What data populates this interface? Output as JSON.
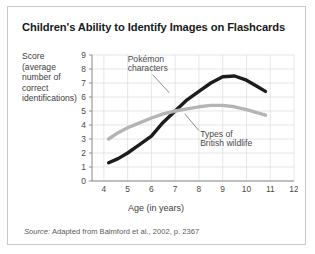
{
  "figure": {
    "title": "Children's Ability to Identify Images on Flashcards",
    "y_axis_caption": "Score (average number of correct identifications)",
    "source_prefix": "Source:",
    "source_text": "Adapted from Balmford et al., 2002, p. 2367"
  },
  "chart_data": {
    "type": "line",
    "title": "Children's Ability to Identify Images on Flashcards",
    "xlabel": "Age (in years)",
    "ylabel": "Score (average number of correct identifications)",
    "xlim": [
      3.5,
      12
    ],
    "ylim": [
      0,
      9
    ],
    "xticks": [
      4,
      5,
      6,
      7,
      8,
      9,
      10,
      11,
      12
    ],
    "yticks": [
      0,
      1,
      2,
      3,
      4,
      5,
      6,
      7,
      8,
      9
    ],
    "grid": true,
    "legend": "inline-annotations",
    "series": [
      {
        "name": "Pokémon characters",
        "color": "#1c1c1c",
        "annotation": "Pokémon characters",
        "points": [
          {
            "x": 4.2,
            "y": 1.3
          },
          {
            "x": 4.6,
            "y": 1.6
          },
          {
            "x": 5.0,
            "y": 2.0
          },
          {
            "x": 5.5,
            "y": 2.6
          },
          {
            "x": 6.0,
            "y": 3.2
          },
          {
            "x": 6.5,
            "y": 4.2
          },
          {
            "x": 7.0,
            "y": 5.0
          },
          {
            "x": 7.5,
            "y": 5.8
          },
          {
            "x": 8.0,
            "y": 6.4
          },
          {
            "x": 8.5,
            "y": 7.0
          },
          {
            "x": 9.0,
            "y": 7.45
          },
          {
            "x": 9.5,
            "y": 7.5
          },
          {
            "x": 10.0,
            "y": 7.2
          },
          {
            "x": 10.4,
            "y": 6.8
          },
          {
            "x": 10.8,
            "y": 6.4
          }
        ]
      },
      {
        "name": "Types of British wildlife",
        "color": "#b4b4b4",
        "annotation": "Types of British wildlife",
        "points": [
          {
            "x": 4.2,
            "y": 3.0
          },
          {
            "x": 4.6,
            "y": 3.45
          },
          {
            "x": 5.0,
            "y": 3.8
          },
          {
            "x": 5.5,
            "y": 4.15
          },
          {
            "x": 6.0,
            "y": 4.5
          },
          {
            "x": 6.5,
            "y": 4.8
          },
          {
            "x": 7.0,
            "y": 5.0
          },
          {
            "x": 7.5,
            "y": 5.15
          },
          {
            "x": 8.0,
            "y": 5.3
          },
          {
            "x": 8.5,
            "y": 5.4
          },
          {
            "x": 9.0,
            "y": 5.4
          },
          {
            "x": 9.5,
            "y": 5.3
          },
          {
            "x": 10.0,
            "y": 5.1
          },
          {
            "x": 10.4,
            "y": 4.9
          },
          {
            "x": 10.8,
            "y": 4.7
          }
        ]
      }
    ],
    "annotations": [
      {
        "text": "Pokémon characters",
        "line1": "Pokémon",
        "line2": "characters"
      },
      {
        "text": "Types of British wildlife",
        "line1": "Types of",
        "line2": "British wildlife"
      }
    ]
  }
}
